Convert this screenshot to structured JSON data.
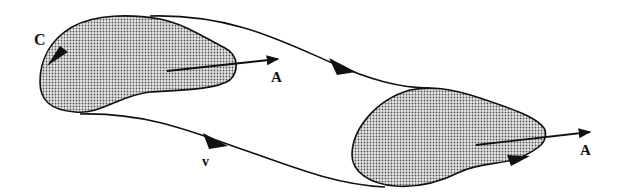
{
  "diagram": {
    "labels": {
      "curve_left": "C",
      "vector_left": "A",
      "vector_right": "A",
      "velocity": "v"
    },
    "regions": [
      {
        "name": "initial-region",
        "fill": "stippled-gray"
      },
      {
        "name": "transported-region",
        "fill": "stippled-gray"
      }
    ],
    "colors": {
      "stroke": "#111111",
      "fill_dot": "#555555",
      "background": "#ffffff"
    }
  }
}
